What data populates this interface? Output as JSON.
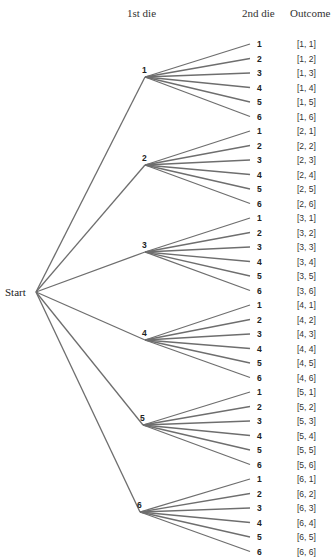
{
  "headers": {
    "first_die": "1st die",
    "second_die": "2nd die",
    "outcome": "Outcome"
  },
  "start_label": "Start",
  "first_die_values": [
    "1",
    "2",
    "3",
    "4",
    "5",
    "6"
  ],
  "second_die_values": [
    "1",
    "2",
    "3",
    "4",
    "5",
    "6"
  ],
  "outcomes": [
    [
      "[1, 1]",
      "[1, 2]",
      "[1, 3]",
      "[1, 4]",
      "[1, 5]",
      "[1, 6]"
    ],
    [
      "[2, 1]",
      "[2, 2]",
      "[2, 3]",
      "[2, 4]",
      "[2, 5]",
      "[2, 6]"
    ],
    [
      "[3, 1]",
      "[3, 2]",
      "[3, 3]",
      "[3, 4]",
      "[3, 5]",
      "[3, 6]"
    ],
    [
      "[4, 1]",
      "[4, 2]",
      "[4, 3]",
      "[4, 4]",
      "[4, 5]",
      "[4, 6]"
    ],
    [
      "[5, 1]",
      "[5, 2]",
      "[5, 3]",
      "[5, 4]",
      "[5, 5]",
      "[5, 6]"
    ],
    [
      "[6, 1]",
      "[6, 2]",
      "[6, 3]",
      "[6, 4]",
      "[6, 5]",
      "[6, 6]"
    ]
  ],
  "colors": {
    "line": "#6e6e6e",
    "text": "#222222"
  }
}
